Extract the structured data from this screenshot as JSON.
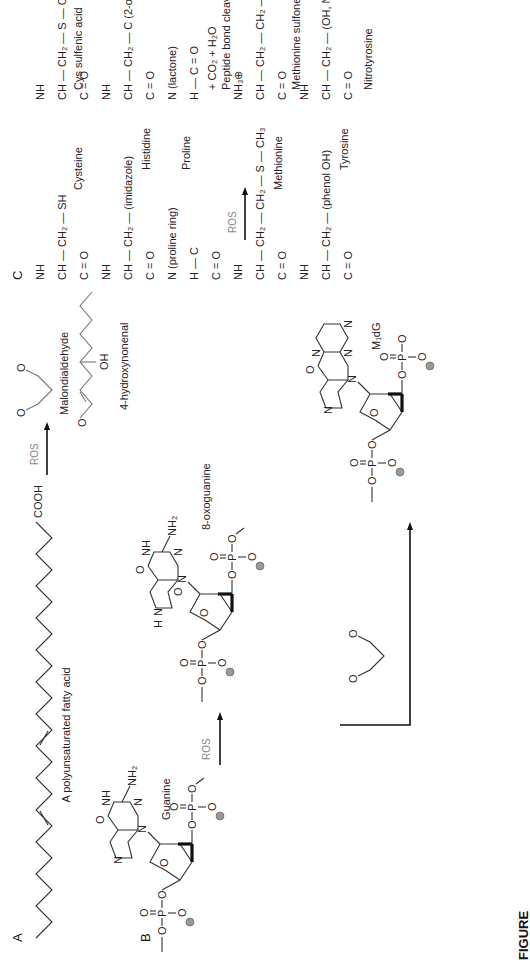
{
  "figure": {
    "orientation": "rotated 90deg counter-clockwise",
    "caption_fragment": "FIGURE",
    "panels": {
      "A": {
        "label": "A",
        "reactant": {
          "name": "A polyunsaturated fatty acid",
          "end_group": "COOH"
        },
        "arrow_label": "ROS",
        "products": [
          {
            "name": "Malondialdehyde",
            "atoms": [
              "O",
              "O"
            ]
          },
          {
            "name": "4-hydroxynonenal",
            "atoms": [
              "O",
              "OH"
            ]
          }
        ]
      },
      "B": {
        "label": "B",
        "reactant": {
          "name": "Guanine",
          "atoms": {
            "carbonyl": "O",
            "imine_nh": "NH",
            "amine": "NH₂",
            "n_ring": "N",
            "n_ring2": "N",
            "n_glyco": "N",
            "sugar_o": "O"
          },
          "phosphates": [
            "O–P=O",
            "O–P=O"
          ]
        },
        "arrow_label": "ROS",
        "oxidized_product": {
          "name": "8-oxoguanine",
          "atoms": {
            "carbonyl": "O",
            "nh": "NH",
            "amine": "NH₂",
            "h": "H",
            "oxo": "O",
            "n": "N"
          }
        },
        "mda_adduct": {
          "reagent": "malondialdehyde",
          "name": "M₁dG",
          "atoms": [
            "O",
            "N",
            "N",
            "N",
            "N"
          ]
        },
        "phosphate_group": {
          "o": "O",
          "p": "P",
          "double_o": "O",
          "charge": "⊖"
        }
      },
      "C": {
        "label": "C",
        "arrow_label": "ROS",
        "native_chain": {
          "backbone": [
            "NH",
            "CH",
            "C=O",
            "NH",
            "CH",
            "C=O",
            "N",
            "C",
            "C=O",
            "NH",
            "CH",
            "C=O",
            "NH",
            "CH",
            "C=O"
          ],
          "residues": [
            {
              "name": "Cysteine",
              "side_chain": "CH₂ — SH"
            },
            {
              "name": "Histidine",
              "side_chain": "CH₂ (imidazole N, NH)"
            },
            {
              "name": "Proline",
              "side_chain": "ring, H"
            },
            {
              "name": "Methionine",
              "side_chain": "CH₂ — CH₂ — S — CH₃"
            },
            {
              "name": "Tyrosine",
              "side_chain": "CH₂ — phenol OH"
            }
          ]
        },
        "oxidized_chain": {
          "residues": [
            {
              "name": "Cys sulfenic acid",
              "side_chain": "CH₂ — S — OH"
            },
            {
              "name": "2-oxohistidine",
              "side_chain": "CH₂ — C (ring N–H, C=O)"
            },
            {
              "name": "proline oxidation",
              "side_chain": "lactone ring",
              "note": "+ CO₂ + H₂O"
            },
            {
              "name": "Peptide bond cleav.",
              "n_terminus": "NH₃⊕"
            },
            {
              "name": "Methionine sulfone",
              "side_chain": "CH₂ — CH₂ — S(=O)(=O) — CH₃"
            },
            {
              "name": "Nitrotyrosine",
              "side_chain": "CH₂ — phenol OH, N⊕(=O)O⊖"
            }
          ]
        }
      }
    }
  },
  "labels": {
    "panelA": "A",
    "panelB": "B",
    "panelC": "C",
    "fatty_acid": "A polyunsaturated fatty acid",
    "cooh": "COOH",
    "ros": "ROS",
    "mda": "Malondialdehyde",
    "hne": "4-hydroxynonenal",
    "guanine": "Guanine",
    "oxoguanine": "8-oxoguanine",
    "m1dg": "M₁dG",
    "cysteine": "Cysteine",
    "histidine": "Histidine",
    "proline": "Proline",
    "methionine": "Methionine",
    "tyrosine": "Tyrosine",
    "cys_sulfenic": "Cys sulfenic acid",
    "co2h2o": "+ CO₂ + H₂O",
    "peptide_cleav": "Peptide bond cleav.",
    "met_sulfone": "Methionine sulfone",
    "nitrotyrosine": "Nitrotyrosine",
    "caption": "FIGURE"
  }
}
